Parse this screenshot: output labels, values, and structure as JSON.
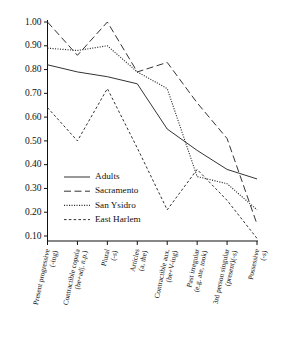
{
  "chart_data": {
    "type": "line",
    "title": "",
    "xlabel": "",
    "ylabel": "",
    "ylim": [
      0.1,
      1.0
    ],
    "yticks": [
      "1.00",
      "0.90",
      "0.80",
      "0.70",
      "0.60",
      "0.50",
      "0.40",
      "0.30",
      "0.20",
      "0.10"
    ],
    "ytick_values": [
      1.0,
      0.9,
      0.8,
      0.7,
      0.6,
      0.5,
      0.4,
      0.3,
      0.2,
      0.1
    ],
    "grid": false,
    "legend_position": "center-left",
    "categories": [
      "Present progressive (-ing)",
      "Contractible copula (be+adj. n.p.)",
      "Plural (-s)",
      "Articles (a, the)",
      "Contractible aux. (be+V-ing)",
      "Past irregular (e.g. ate, took)",
      "3rd person singular (present)(-s)",
      "Possessive (-s)"
    ],
    "categories_lines": [
      [
        "Present progressive",
        "(-ing)"
      ],
      [
        "Contractible copula",
        "(be+adj. n.p.)"
      ],
      [
        "Plural",
        "(-s)"
      ],
      [
        "Articles",
        "(a, the)"
      ],
      [
        "Contractible aux.",
        "(be+V-ing)"
      ],
      [
        "Past irregular",
        "(e.g. ate, took)"
      ],
      [
        "3rd person singular",
        "(present)(-s)"
      ],
      [
        "Possessive",
        "(-s)"
      ]
    ],
    "series": [
      {
        "name": "Adults",
        "dash": "none",
        "color": "#333333",
        "values": [
          0.82,
          0.79,
          0.77,
          0.74,
          0.55,
          0.46,
          0.38,
          0.34
        ]
      },
      {
        "name": "Sacramento",
        "dash": "long",
        "color": "#333333",
        "values": [
          1.0,
          0.86,
          1.0,
          0.79,
          0.83,
          0.66,
          0.51,
          0.15
        ]
      },
      {
        "name": "San Ysidro",
        "dash": "dotted",
        "color": "#333333",
        "values": [
          0.89,
          0.88,
          0.9,
          0.79,
          0.72,
          0.35,
          0.32,
          0.21
        ]
      },
      {
        "name": "East Harlem",
        "dash": "short",
        "color": "#333333",
        "values": [
          0.64,
          0.5,
          0.72,
          0.47,
          0.21,
          0.38,
          0.25,
          0.09
        ]
      }
    ]
  },
  "legend": {
    "items": [
      {
        "label": "Adults"
      },
      {
        "label": "Sacramento"
      },
      {
        "label": "San Ysidro"
      },
      {
        "label": "East Harlem"
      }
    ]
  }
}
